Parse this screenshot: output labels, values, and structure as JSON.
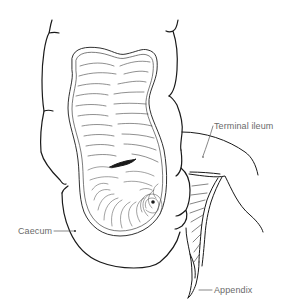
{
  "figure": {
    "stroke_color": "#1a1a1a",
    "label_color": "#6a6a6a",
    "background": "#ffffff"
  },
  "labels": {
    "terminal_ileum": "Terminal ileum",
    "caecum": "Caecum",
    "appendix": "Appendix"
  }
}
